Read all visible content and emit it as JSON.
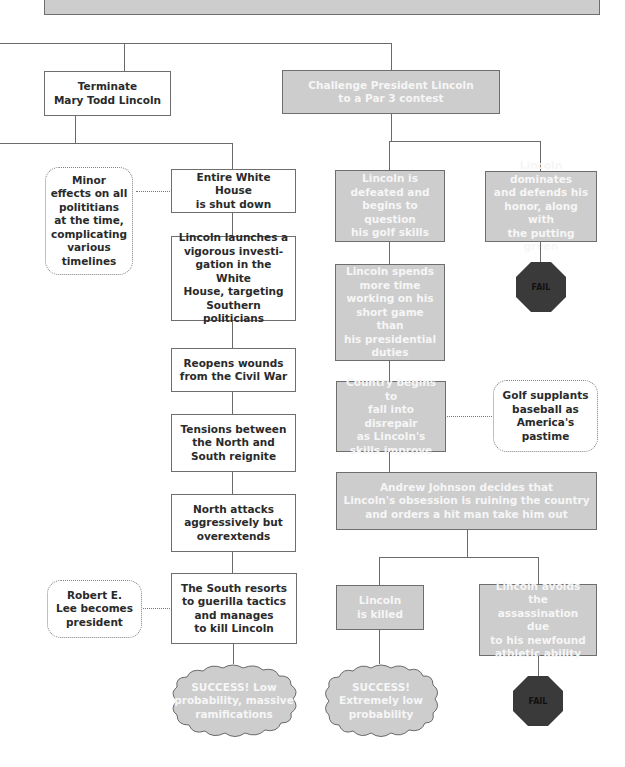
{
  "colors": {
    "gray_box": "#cdcdcd",
    "gray_text": "#f6f6f6",
    "white_box": "#ffffff",
    "dark_text": "#2a2a2a",
    "fail_octagon": "#3a3a3a",
    "line": "#6a6a6a"
  },
  "top_bar": {
    "label": ""
  },
  "left_branch": {
    "root": "Terminate\nMary Todd Lincoln",
    "steps": [
      "Entire White House\nis shut down",
      "Lincoln launches a\nvigorous investi-\ngation in the White\nHouse, targeting\nSouthern politicians",
      "Reopens wounds\nfrom the Civil War",
      "Tensions between\nthe North and\nSouth reignite",
      "North attacks\naggressively but\noverextends",
      "The South resorts\nto guerilla tactics\nand manages\nto kill Lincoln"
    ],
    "notes": [
      "Minor\neffects on all\npolititians\nat the time,\ncomplicating\nvarious\ntimelines",
      "Robert E.\nLee becomes\npresident"
    ],
    "outcome": "SUCCESS! Low\nprobability, massive\nramifications"
  },
  "right_branch": {
    "root": "Challenge President Lincoln\nto a Par 3 contest",
    "defeated": "Lincoln is\ndefeated and\nbegins to question\nhis golf skills",
    "dominates": "Lincoln dominates\nand defends his\nhonor, along with\nthe putting green",
    "fail_1": "FAIL",
    "spends_time": "Lincoln spends\nmore time\nworking on his\nshort game than\nhis presidential\nduties",
    "disrepair": "Country begins to\nfall into disrepair\nas Lincoln's\nskills improve",
    "note": "Golf supplants\nbaseball as\nAmerica's\npastime",
    "johnson": "Andrew Johnson decides that\nLincoln's obsession is ruining the country\nand orders a hit man take him out",
    "killed": "Lincoln\nis killed",
    "avoids": "Lincoln avoids the\nassassination due\nto his newfound\nathletic ability",
    "outcome": "SUCCESS!\nExtremely low\nprobability",
    "fail_2": "FAIL"
  }
}
